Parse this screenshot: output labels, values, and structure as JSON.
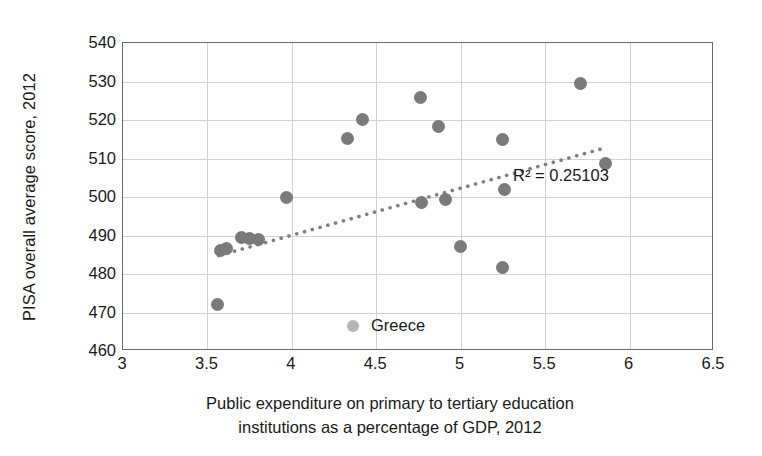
{
  "chart_data": {
    "type": "scatter",
    "title": "",
    "xlabel": "Public expenditure on primary to tertiary education institutions as a percentage of GDP, 2012",
    "xlabel_line1": "Public expenditure on primary to tertiary education",
    "xlabel_line2": "institutions as a percentage of GDP, 2012",
    "ylabel": "PISA overall average score, 2012",
    "xlim": [
      3,
      6.5
    ],
    "ylim": [
      460,
      540
    ],
    "xticks": [
      3,
      3.5,
      4,
      4.5,
      5,
      5.5,
      6,
      6.5
    ],
    "xtick_labels": [
      "3",
      "3.5",
      "4",
      "4.5",
      "5",
      "5.5",
      "6",
      "6.5"
    ],
    "yticks": [
      460,
      470,
      480,
      490,
      500,
      510,
      520,
      530,
      540
    ],
    "ytick_labels": [
      "460",
      "470",
      "480",
      "490",
      "500",
      "510",
      "520",
      "530",
      "540"
    ],
    "grid": true,
    "grid_color": "#d2d2d2",
    "marker_color": "#7a7a7a",
    "legend": [
      {
        "label": "Greece",
        "marker": "circle",
        "color": "#b6b6b6"
      }
    ],
    "legend_position": "inside-bottom-center",
    "annotations": [
      {
        "name": "r-squared",
        "text": "R² = 0.25103",
        "x": 5.31,
        "y": 503.5
      }
    ],
    "trendline": {
      "style": "dotted",
      "color": "#808080",
      "r_squared": 0.25103,
      "x_start": 3.57,
      "y_start": 484.6,
      "x_end": 5.86,
      "y_end": 512.6
    },
    "points": [
      {
        "x": 3.56,
        "y": 472.0
      },
      {
        "x": 3.58,
        "y": 486.2
      },
      {
        "x": 3.61,
        "y": 486.5
      },
      {
        "x": 3.7,
        "y": 489.6
      },
      {
        "x": 3.75,
        "y": 489.2
      },
      {
        "x": 3.8,
        "y": 489.0
      },
      {
        "x": 3.97,
        "y": 500.0
      },
      {
        "x": 4.33,
        "y": 515.2
      },
      {
        "x": 4.42,
        "y": 520.2
      },
      {
        "x": 4.76,
        "y": 525.8
      },
      {
        "x": 4.77,
        "y": 498.5
      },
      {
        "x": 4.87,
        "y": 518.4
      },
      {
        "x": 4.91,
        "y": 499.4
      },
      {
        "x": 5.0,
        "y": 487.2
      },
      {
        "x": 5.25,
        "y": 515.0
      },
      {
        "x": 5.25,
        "y": 481.6
      },
      {
        "x": 5.26,
        "y": 501.9
      },
      {
        "x": 5.71,
        "y": 529.4
      },
      {
        "x": 5.86,
        "y": 508.7
      }
    ]
  }
}
